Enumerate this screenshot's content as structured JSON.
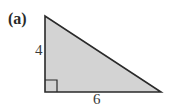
{
  "figure": {
    "part_label": "(a)",
    "shape": "right-triangle",
    "fill_color": "#d3d3d3",
    "stroke_color": "#2a2a2a",
    "vertices": {
      "top": [
        45,
        16
      ],
      "right_angle": [
        45,
        92
      ],
      "right": [
        161,
        92
      ]
    },
    "sides": {
      "vertical_leg": "4",
      "horizontal_leg": "6"
    },
    "right_angle_marker": true
  }
}
